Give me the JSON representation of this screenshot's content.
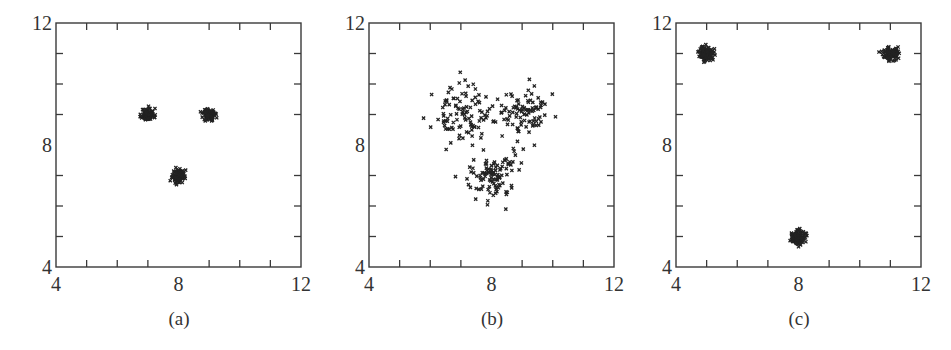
{
  "figure": {
    "background": "#ffffff",
    "axis_color": "#3a3a3a",
    "marker_color": "#222222",
    "marker_glyph": "x"
  },
  "chart_data": [
    {
      "type": "scatter",
      "caption": "(a)",
      "title": "",
      "xlabel": "",
      "ylabel": "",
      "xlim": [
        4,
        12
      ],
      "ylim": [
        4,
        12
      ],
      "x_tick_labels": [
        "4",
        "8",
        "12"
      ],
      "y_tick_labels": [
        "4",
        "8",
        "12"
      ],
      "minor_ticks": [
        5,
        6,
        7,
        9,
        10,
        11
      ],
      "grid": false,
      "clusters": [
        {
          "name": "cluster-1",
          "center": [
            7,
            9
          ],
          "std": 0.1,
          "count": 100
        },
        {
          "name": "cluster-2",
          "center": [
            9,
            9
          ],
          "std": 0.1,
          "count": 100
        },
        {
          "name": "cluster-3",
          "center": [
            8,
            7
          ],
          "std": 0.1,
          "count": 100
        }
      ],
      "seed": 11
    },
    {
      "type": "scatter",
      "caption": "(b)",
      "title": "",
      "xlabel": "",
      "ylabel": "",
      "xlim": [
        4,
        12
      ],
      "ylim": [
        4,
        12
      ],
      "x_tick_labels": [
        "4",
        "8",
        "12"
      ],
      "y_tick_labels": [
        "4",
        "8",
        "12"
      ],
      "minor_ticks": [
        5,
        6,
        7,
        9,
        10,
        11
      ],
      "grid": false,
      "clusters": [
        {
          "name": "cluster-1",
          "center": [
            7,
            9
          ],
          "std": 0.45,
          "count": 100
        },
        {
          "name": "cluster-2",
          "center": [
            9,
            9
          ],
          "std": 0.45,
          "count": 100
        },
        {
          "name": "cluster-3",
          "center": [
            8,
            7
          ],
          "std": 0.4,
          "count": 100
        }
      ],
      "seed": 23
    },
    {
      "type": "scatter",
      "caption": "(c)",
      "title": "",
      "xlabel": "",
      "ylabel": "",
      "xlim": [
        4,
        12
      ],
      "ylim": [
        4,
        12
      ],
      "x_tick_labels": [
        "4",
        "8",
        "12"
      ],
      "y_tick_labels": [
        "4",
        "8",
        "12"
      ],
      "minor_ticks": [
        5,
        6,
        7,
        9,
        10,
        11
      ],
      "grid": false,
      "clusters": [
        {
          "name": "cluster-1",
          "center": [
            5,
            11
          ],
          "std": 0.12,
          "count": 100
        },
        {
          "name": "cluster-2",
          "center": [
            11,
            11
          ],
          "std": 0.12,
          "count": 100
        },
        {
          "name": "cluster-3",
          "center": [
            8,
            5
          ],
          "std": 0.12,
          "count": 100
        }
      ],
      "seed": 37
    }
  ]
}
